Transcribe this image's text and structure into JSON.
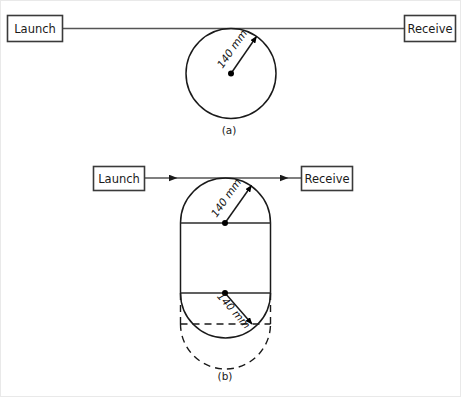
{
  "figure": {
    "background_color": "#ffffff",
    "line_color": "#1a1a1a",
    "connector_color": "#555555",
    "panels": [
      {
        "id": "panel-a",
        "caption": "(a)",
        "launch_label": "Launch",
        "receive_label": "Receive",
        "shape": "circle",
        "dimension_labels": [
          "140 mm"
        ],
        "has_arrowheads": false,
        "has_dashed_overlay": false
      },
      {
        "id": "panel-b",
        "caption": "(b)",
        "launch_label": "Launch",
        "receive_label": "Receive",
        "shape": "stadium",
        "dimension_labels": [
          "140 mm",
          "140 mm"
        ],
        "has_arrowheads": true,
        "has_dashed_overlay": true
      }
    ]
  },
  "panel_a": {
    "launch_label": "Launch",
    "receive_label": "Receive",
    "radius_label": "140 mm",
    "caption": "(a)"
  },
  "panel_b": {
    "launch_label": "Launch",
    "receive_label": "Receive",
    "radius_label_top": "140 mm",
    "radius_label_bottom": "140 mm",
    "caption": "(b)"
  }
}
